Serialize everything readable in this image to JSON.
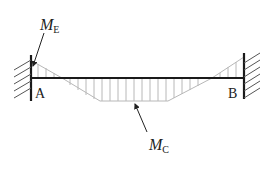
{
  "diagram": {
    "type": "bending-moment-diagram",
    "labels": {
      "left_support": "A",
      "right_support": "B",
      "end_moment_symbol": "M",
      "end_moment_subscript": "E",
      "center_moment_symbol": "M",
      "center_moment_subscript": "C"
    },
    "colors": {
      "beam": "#1a1a1a",
      "hatch": "#b5b5b5",
      "diagram_outline": "#b5b5b5",
      "wall_hatch": "#555555",
      "text": "#222222"
    }
  }
}
